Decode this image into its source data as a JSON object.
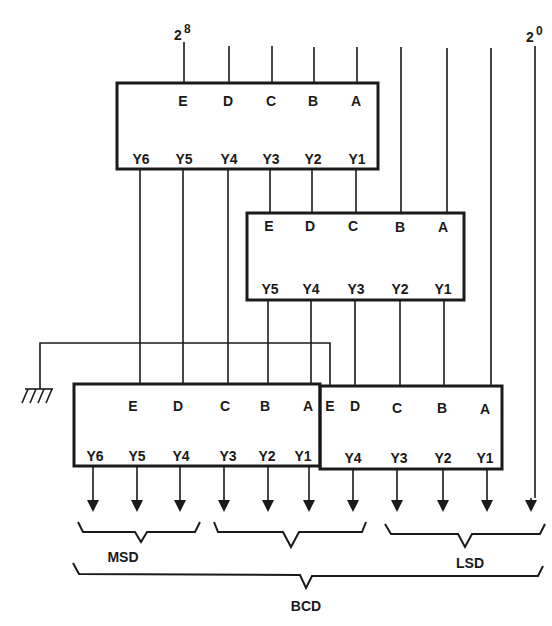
{
  "inputs": {
    "msb_label": "2",
    "msb_exp": "8",
    "lsb_label": "2",
    "lsb_exp": "0"
  },
  "blocks": [
    {
      "id": "top",
      "inputs": [
        "E",
        "D",
        "C",
        "B",
        "A"
      ],
      "outputs": [
        "Y6",
        "Y5",
        "Y4",
        "Y3",
        "Y2",
        "Y1"
      ]
    },
    {
      "id": "middle",
      "inputs": [
        "E",
        "D",
        "C",
        "B",
        "A"
      ],
      "outputs": [
        "Y5",
        "Y4",
        "Y3",
        "Y2",
        "Y1"
      ]
    },
    {
      "id": "bottom-left",
      "inputs": [
        "E",
        "D",
        "C",
        "B",
        "A"
      ],
      "outputs": [
        "Y6",
        "Y5",
        "Y4",
        "Y3",
        "Y2",
        "Y1"
      ]
    },
    {
      "id": "bottom-right",
      "inputs": [
        "E",
        "D",
        "C",
        "B",
        "A"
      ],
      "outputs": [
        "Y4",
        "Y3",
        "Y2",
        "Y1"
      ]
    }
  ],
  "groups": {
    "msd": "MSD",
    "lsd": "LSD",
    "bcd": "BCD"
  },
  "ground": "ground-symbol"
}
